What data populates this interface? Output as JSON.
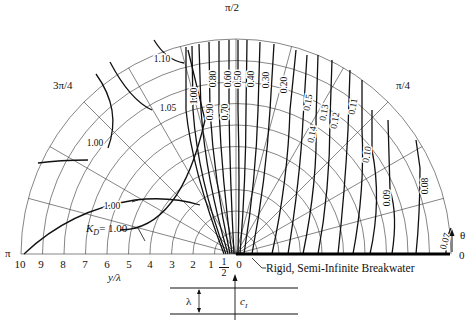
{
  "chart_data": {
    "type": "line",
    "xlabel": "y/λ",
    "ylabel": "",
    "angle_labels": [
      {
        "label": "0",
        "angle_deg": 0
      },
      {
        "label": "π/4",
        "angle_deg": 45
      },
      {
        "label": "π/2",
        "angle_deg": 90
      },
      {
        "label": "3π/4",
        "angle_deg": 135
      },
      {
        "label": "π",
        "angle_deg": 180
      }
    ],
    "radial_ticks": [
      "10",
      "9",
      "8",
      "7",
      "6",
      "5",
      "4",
      "3",
      "2",
      "1",
      "1/2",
      "0"
    ],
    "radial_range": [
      0,
      10
    ],
    "grid": {
      "arcs_r": [
        1,
        2,
        3,
        4,
        5,
        6,
        7,
        8,
        9,
        10
      ],
      "radial_lines_deg": [
        15,
        30,
        45,
        60,
        75,
        90,
        105,
        120,
        135,
        150,
        165
      ]
    },
    "theta_arrow_label": "θ",
    "annotations": {
      "breakwater": "Rigid, Semi-Infinite Breakwater",
      "kd_label": "K_D = 1.00",
      "wavelength": "λ",
      "crest_label": "c_I",
      "half_tick": "1/2"
    },
    "series": [
      {
        "name": "0.07",
        "values": "contour near θ≈5°, r≈8.5-9.8"
      },
      {
        "name": "0.08",
        "values": "contour θ≈10-25°, r≈8-9"
      },
      {
        "name": "0.09",
        "values": "contour θ≈20-45°"
      },
      {
        "name": "0.10",
        "values": "contour θ≈25-55°"
      },
      {
        "name": "0.11",
        "values": "contour θ≈35-60°"
      },
      {
        "name": "0.12",
        "values": "contour θ≈50-65°"
      },
      {
        "name": "0.13",
        "values": "contour θ≈55-68°"
      },
      {
        "name": "0.14",
        "values": "contour θ≈60-70°"
      },
      {
        "name": "0.15",
        "values": "contour θ≈62-72°"
      },
      {
        "name": "0.20",
        "values": "contour θ≈72-78°"
      },
      {
        "name": "0.30",
        "values": "contour θ≈80-84°"
      },
      {
        "name": "0.40",
        "values": "contour θ≈84-86°"
      },
      {
        "name": "0.50",
        "values": "contour θ≈88-89°"
      },
      {
        "name": "0.60",
        "values": "contour θ≈90°"
      },
      {
        "name": "0.70",
        "values": "contour θ≈92°"
      },
      {
        "name": "0.80",
        "values": "contour θ≈94°"
      },
      {
        "name": "0.90",
        "values": "contour θ≈96°"
      },
      {
        "name": "1.00",
        "values": "contour θ≈98-100°"
      },
      {
        "name": "1.05",
        "values": "contour θ≈105-125°"
      },
      {
        "name": "1.10",
        "values": "contour θ≈107-120° (outer)"
      },
      {
        "name": "1.00 (left)",
        "values": "contours near θ≈130-170°"
      }
    ],
    "contour_labels": [
      {
        "text": "1.10",
        "x": 162,
        "y": 62,
        "rot": 0
      },
      {
        "text": "1.05",
        "x": 168,
        "y": 111,
        "rot": 0
      },
      {
        "text": "1.00",
        "x": 95,
        "y": 146,
        "rot": 0
      },
      {
        "text": "1.00",
        "x": 112,
        "y": 209,
        "rot": 0
      },
      {
        "text": "1.00",
        "x": 197,
        "y": 96,
        "rot": -90
      },
      {
        "text": "0.90",
        "x": 213,
        "y": 112,
        "rot": -90
      },
      {
        "text": "0.80",
        "x": 216,
        "y": 79,
        "rot": -90
      },
      {
        "text": "0.70",
        "x": 228,
        "y": 112,
        "rot": -90
      },
      {
        "text": "0.60",
        "x": 231,
        "y": 79,
        "rot": -90
      },
      {
        "text": "0.50",
        "x": 241,
        "y": 79,
        "rot": -90
      },
      {
        "text": "0.40",
        "x": 254,
        "y": 79,
        "rot": -90
      },
      {
        "text": "0.30",
        "x": 269,
        "y": 80,
        "rot": -90
      },
      {
        "text": "0.20",
        "x": 287,
        "y": 85,
        "rot": -90
      },
      {
        "text": "0.15",
        "x": 311,
        "y": 103,
        "rot": -80
      },
      {
        "text": "0.14",
        "x": 315,
        "y": 135,
        "rot": -80
      },
      {
        "text": "0.13",
        "x": 327,
        "y": 113,
        "rot": -80
      },
      {
        "text": "0.12",
        "x": 338,
        "y": 121,
        "rot": -80
      },
      {
        "text": "0.11",
        "x": 356,
        "y": 107,
        "rot": -80
      },
      {
        "text": "0.10",
        "x": 370,
        "y": 155,
        "rot": -80
      },
      {
        "text": "0.09",
        "x": 390,
        "y": 198,
        "rot": -90
      },
      {
        "text": "0.08",
        "x": 428,
        "y": 186,
        "rot": -90
      },
      {
        "text": "0.07",
        "x": 448,
        "y": 242,
        "rot": -75
      }
    ]
  },
  "labels": {
    "pi_half": "π/2",
    "pi_quarter": "π/4",
    "three_pi_quarter": "3π/4",
    "pi": "π",
    "zero": "0",
    "theta": "θ",
    "xlabel": "y/λ",
    "breakwater": "Rigid, Semi-Infinite Breakwater",
    "kd_k": "K",
    "kd_sub": "D",
    "kd_val": "= 1.00",
    "lambda": "λ",
    "c": "c",
    "c_sub": "I",
    "half_num": "1",
    "half_den": "2"
  },
  "ticks": [
    {
      "t": "10",
      "x": 20
    },
    {
      "t": "9",
      "x": 41
    },
    {
      "t": "8",
      "x": 63
    },
    {
      "t": "7",
      "x": 85
    },
    {
      "t": "6",
      "x": 107
    },
    {
      "t": "5",
      "x": 129
    },
    {
      "t": "4",
      "x": 150
    },
    {
      "t": "3",
      "x": 172
    },
    {
      "t": "2",
      "x": 193
    },
    {
      "t": "1",
      "x": 211
    },
    {
      "t": "0",
      "x": 239
    }
  ]
}
